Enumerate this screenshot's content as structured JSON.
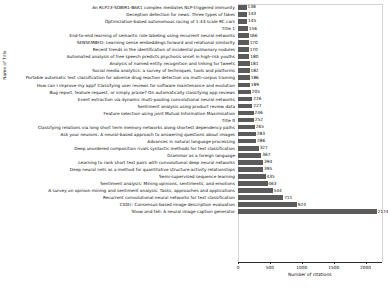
{
  "chart_data": {
    "type": "bar",
    "orientation": "horizontal",
    "title": "",
    "xlabel": "Number of citations",
    "ylabel": "Name of Title",
    "xlim": [
      0,
      2250
    ],
    "xticks": [
      0,
      500,
      1000,
      1500,
      2000
    ],
    "grid": false,
    "legend": null,
    "bar_color": "#5b5b5b",
    "categories": [
      "An RLP23-SOBIR1-BAK1 complex mediates NLP-triggered immunity",
      "Deception detection for news: Three types of fakes",
      "Optimization-based autonomous racing of 1:43 scale RC cars",
      "Title 1",
      "End-to-end learning of semantic role labeling using recurrent neural networks",
      "SENSEMBED: Learning sense embeddings forword and relational similarity",
      "Recent trends in the identification of incidental pulmonary nodules",
      "Automated analysis of free speech predicts psychosis onset in high-risk youths",
      "Analysis of named entity recognition and linking for tweets",
      "Social media analytics: a survey of techniques, tools and platforms",
      "Portable automatic text classification for adverse drug reaction detection via multi-corpus training",
      "How can I improve my app? Classifying user reviews for software maintenance and evolution",
      "Bug report, feature request, or simply praise? On automatically classifying app reviews",
      "Event extraction via dynamic multi-pooling convolutional neural networks",
      "Sentiment analysis using product review data",
      "Feature selection using joint Mutual Information Maximisation",
      "Title 0",
      "Classifying relations via long short term memory networks along shortest dependency paths",
      "Ask your neurons: A neural-based approach to answering questions about images",
      "Advances in natural language processing",
      "Deep unordered composition rivals syntactic methods for text classification",
      "Grammar as a foreign language",
      "Learning to rank short text pairs with convolutional deep neural networks",
      "Deep neural nets as a method for quantitative structure-activity relationships",
      "Semi-supervised sequence learning",
      "Sentiment analysis: Mining opinions, sentiments, and emotions",
      "A survey on opinion mining and sentiment analysis: Tasks, approaches and applications",
      "Recurrent convolutional neural networks for text classification",
      "CIDEr: Consensus-based image description evaluation",
      "Show and tell: A neural image caption generator"
    ],
    "values": [
      138,
      143,
      145,
      156,
      166,
      170,
      170,
      180,
      181,
      182,
      186,
      189,
      205,
      226,
      227,
      246,
      252,
      265,
      283,
      286,
      327,
      367,
      394,
      395,
      435,
      463,
      544,
      711,
      924,
      2174
    ]
  }
}
